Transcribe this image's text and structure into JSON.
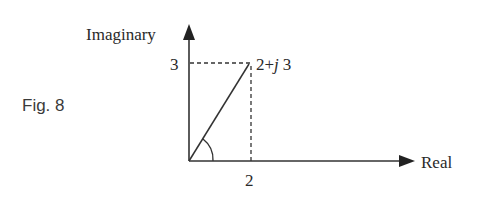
{
  "figure": {
    "caption": "Fig. 8",
    "axes": {
      "x_label": "Real",
      "y_label": "Imaginary"
    },
    "point": {
      "label_re": "2",
      "label_op": "+",
      "label_j": "j",
      "label_im": "3",
      "re": 2,
      "im": 3
    },
    "ticks": {
      "x": "2",
      "y": "3"
    },
    "angle_marker": "arc at origin"
  }
}
